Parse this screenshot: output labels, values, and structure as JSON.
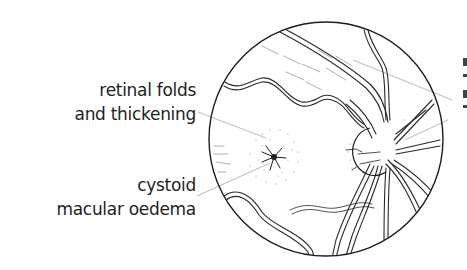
{
  "figure": {
    "colors": {
      "background": "#ffffff",
      "ink": "#222222",
      "leader_line": "#c4c4c4"
    }
  },
  "labels": {
    "retinal_folds": {
      "line1": "retinal folds",
      "line2": "and thickening"
    },
    "cystoid_oedema": {
      "line1": "cystoid",
      "line2": "macular oedema"
    }
  },
  "structures": {
    "fundus_circle": "fundus-outline",
    "optic_disc": "optic-disc",
    "macula": "macular-star",
    "vessels": "retinal-vessels"
  }
}
